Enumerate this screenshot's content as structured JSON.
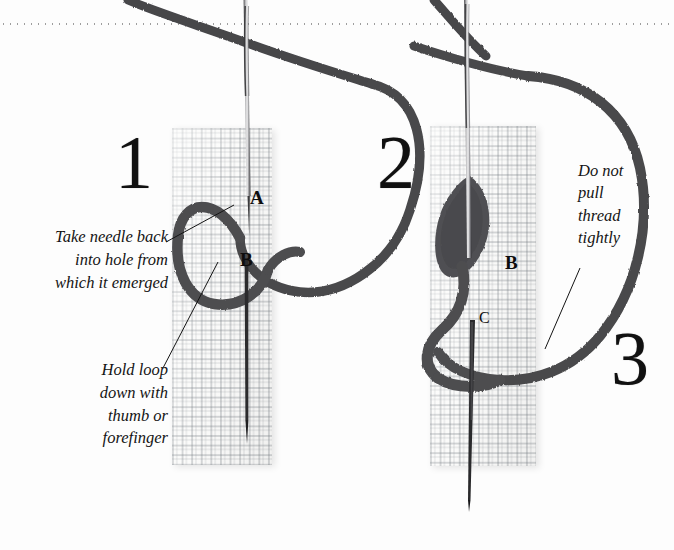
{
  "figure": {
    "background_color": "#fdfdfd",
    "thread_color": "#4a4a4c",
    "needle_color": "#6e6e70",
    "fabric_color": "#fbfbfa",
    "text_color": "#141414"
  },
  "divider": {
    "style": "dotted",
    "color": "#8d8d8d"
  },
  "steps": [
    {
      "number": "1"
    },
    {
      "number": "2"
    },
    {
      "number": "3"
    }
  ],
  "captions": {
    "take_needle_back": "Take needle back\ninto hole from\nwhich it emerged",
    "hold_loop_down": "Hold loop\ndown with\nthumb or\nforefinger",
    "do_not_pull": "Do not\npull\nthread\ntightly"
  },
  "point_labels": {
    "panel1_a": "A",
    "panel1_b": "B",
    "panel2_b": "B",
    "panel2_c": "C"
  }
}
